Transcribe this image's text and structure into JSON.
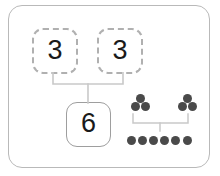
{
  "diagram": {
    "type": "number-bond",
    "colors": {
      "frame_border": "#b9b9b9",
      "dashed_box_border": "#b0b0b0",
      "solid_box_border": "#9e9e9e",
      "connector_line": "#c9c9c9",
      "dot_fill": "#4a4a4a",
      "numeral": "#1a1a1a",
      "background": "#ffffff"
    },
    "boxes": {
      "part_left": {
        "value": "3",
        "border_style": "dashed"
      },
      "part_right": {
        "value": "3",
        "border_style": "dashed"
      },
      "whole": {
        "value": "6",
        "border_style": "solid"
      }
    },
    "dot_model": {
      "part_left_count": 3,
      "part_right_count": 3,
      "whole_count": 6,
      "part_left_layout": [
        1,
        2
      ],
      "part_right_layout": [
        1,
        2
      ],
      "whole_layout": [
        6
      ]
    }
  }
}
